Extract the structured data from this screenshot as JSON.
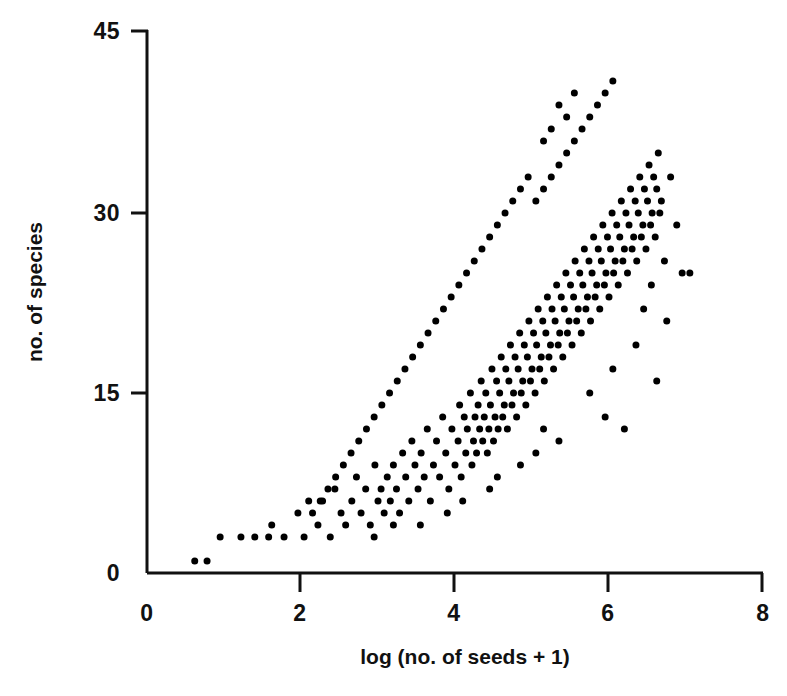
{
  "chart_data": {
    "type": "scatter",
    "title": "",
    "subtitle": "",
    "xlabel": "log (no. of seeds + 1)",
    "ylabel": "no. of species",
    "xlim": [
      0,
      8
    ],
    "ylim": [
      0,
      45
    ],
    "xticks": [
      0,
      2,
      4,
      6,
      8
    ],
    "yticks": [
      0,
      15,
      30,
      45
    ],
    "xtick_labels": [
      "0",
      "2",
      "4",
      "6",
      "8"
    ],
    "ytick_labels": [
      "0",
      "15",
      "30",
      "45"
    ],
    "grid": false,
    "legend": null,
    "marker": {
      "shape": "circle",
      "color": "#000000",
      "size_px": 7
    },
    "series": [
      {
        "name": "sites",
        "points": [
          [
            0.62,
            1
          ],
          [
            0.78,
            1
          ],
          [
            0.95,
            3
          ],
          [
            1.22,
            3
          ],
          [
            1.4,
            3
          ],
          [
            1.58,
            3
          ],
          [
            1.62,
            4
          ],
          [
            1.78,
            3
          ],
          [
            1.96,
            5
          ],
          [
            2.04,
            3
          ],
          [
            2.1,
            6
          ],
          [
            2.22,
            4
          ],
          [
            2.28,
            6
          ],
          [
            2.38,
            3
          ],
          [
            2.44,
            7
          ],
          [
            2.52,
            5
          ],
          [
            2.58,
            4
          ],
          [
            2.66,
            6
          ],
          [
            2.72,
            8
          ],
          [
            2.78,
            5
          ],
          [
            2.84,
            7
          ],
          [
            2.9,
            4
          ],
          [
            2.96,
            9
          ],
          [
            3.0,
            6
          ],
          [
            3.04,
            7
          ],
          [
            3.08,
            5
          ],
          [
            3.12,
            8
          ],
          [
            3.16,
            6
          ],
          [
            3.2,
            9
          ],
          [
            3.24,
            7
          ],
          [
            3.28,
            5
          ],
          [
            3.32,
            10
          ],
          [
            3.36,
            8
          ],
          [
            3.4,
            6
          ],
          [
            3.44,
            11
          ],
          [
            3.48,
            9
          ],
          [
            3.52,
            7
          ],
          [
            3.56,
            10
          ],
          [
            3.6,
            8
          ],
          [
            3.64,
            12
          ],
          [
            3.68,
            6
          ],
          [
            3.72,
            9
          ],
          [
            3.76,
            11
          ],
          [
            3.8,
            8
          ],
          [
            3.84,
            13
          ],
          [
            3.88,
            10
          ],
          [
            3.92,
            7
          ],
          [
            3.96,
            12
          ],
          [
            4.0,
            9
          ],
          [
            4.04,
            11
          ],
          [
            4.06,
            14
          ],
          [
            4.08,
            8
          ],
          [
            4.12,
            13
          ],
          [
            4.14,
            10
          ],
          [
            4.16,
            12
          ],
          [
            4.2,
            15
          ],
          [
            4.22,
            9
          ],
          [
            4.24,
            11
          ],
          [
            4.26,
            13
          ],
          [
            4.28,
            10
          ],
          [
            4.3,
            14
          ],
          [
            4.32,
            12
          ],
          [
            4.34,
            16
          ],
          [
            4.36,
            11
          ],
          [
            4.38,
            13
          ],
          [
            4.4,
            15
          ],
          [
            4.42,
            10
          ],
          [
            4.44,
            12
          ],
          [
            4.46,
            14
          ],
          [
            4.48,
            17
          ],
          [
            4.5,
            11
          ],
          [
            4.52,
            13
          ],
          [
            4.54,
            16
          ],
          [
            4.56,
            12
          ],
          [
            4.58,
            15
          ],
          [
            4.6,
            18
          ],
          [
            4.62,
            13
          ],
          [
            4.64,
            14
          ],
          [
            4.66,
            17
          ],
          [
            4.68,
            12
          ],
          [
            4.7,
            16
          ],
          [
            4.72,
            19
          ],
          [
            4.74,
            14
          ],
          [
            4.76,
            15
          ],
          [
            4.78,
            18
          ],
          [
            4.8,
            13
          ],
          [
            4.82,
            17
          ],
          [
            4.84,
            20
          ],
          [
            4.86,
            15
          ],
          [
            4.88,
            16
          ],
          [
            4.9,
            19
          ],
          [
            4.92,
            14
          ],
          [
            4.94,
            18
          ],
          [
            4.96,
            21
          ],
          [
            4.98,
            16
          ],
          [
            5.0,
            17
          ],
          [
            5.02,
            20
          ],
          [
            5.04,
            15
          ],
          [
            5.06,
            19
          ],
          [
            5.08,
            22
          ],
          [
            5.1,
            17
          ],
          [
            5.12,
            18
          ],
          [
            5.14,
            21
          ],
          [
            5.16,
            16
          ],
          [
            5.18,
            20
          ],
          [
            5.2,
            23
          ],
          [
            5.22,
            18
          ],
          [
            5.24,
            19
          ],
          [
            5.26,
            22
          ],
          [
            5.28,
            17
          ],
          [
            5.3,
            21
          ],
          [
            5.32,
            24
          ],
          [
            5.34,
            19
          ],
          [
            5.36,
            20
          ],
          [
            5.38,
            23
          ],
          [
            5.4,
            18
          ],
          [
            5.42,
            22
          ],
          [
            5.44,
            25
          ],
          [
            5.46,
            20
          ],
          [
            5.48,
            21
          ],
          [
            5.5,
            24
          ],
          [
            5.52,
            19
          ],
          [
            5.54,
            23
          ],
          [
            5.56,
            26
          ],
          [
            5.58,
            21
          ],
          [
            5.6,
            22
          ],
          [
            5.62,
            25
          ],
          [
            5.64,
            20
          ],
          [
            5.66,
            24
          ],
          [
            5.68,
            27
          ],
          [
            5.7,
            22
          ],
          [
            5.72,
            23
          ],
          [
            5.74,
            26
          ],
          [
            5.76,
            21
          ],
          [
            5.78,
            25
          ],
          [
            5.8,
            28
          ],
          [
            5.82,
            23
          ],
          [
            5.84,
            24
          ],
          [
            5.86,
            27
          ],
          [
            5.88,
            22
          ],
          [
            5.9,
            26
          ],
          [
            5.92,
            29
          ],
          [
            5.94,
            24
          ],
          [
            5.96,
            25
          ],
          [
            5.98,
            28
          ],
          [
            6.0,
            23
          ],
          [
            6.02,
            27
          ],
          [
            6.04,
            30
          ],
          [
            6.06,
            25
          ],
          [
            6.08,
            26
          ],
          [
            6.1,
            29
          ],
          [
            6.12,
            24
          ],
          [
            6.14,
            28
          ],
          [
            6.16,
            31
          ],
          [
            6.18,
            26
          ],
          [
            6.2,
            27
          ],
          [
            6.22,
            30
          ],
          [
            6.24,
            25
          ],
          [
            6.26,
            29
          ],
          [
            6.28,
            32
          ],
          [
            6.3,
            27
          ],
          [
            6.32,
            28
          ],
          [
            6.34,
            31
          ],
          [
            6.36,
            26
          ],
          [
            6.38,
            30
          ],
          [
            6.4,
            33
          ],
          [
            6.42,
            28
          ],
          [
            6.44,
            29
          ],
          [
            6.46,
            32
          ],
          [
            6.48,
            27
          ],
          [
            6.5,
            31
          ],
          [
            6.52,
            34
          ],
          [
            6.54,
            29
          ],
          [
            6.56,
            30
          ],
          [
            6.58,
            33
          ],
          [
            6.6,
            28
          ],
          [
            6.62,
            32
          ],
          [
            6.64,
            35
          ],
          [
            6.66,
            30
          ],
          [
            6.68,
            31
          ],
          [
            5.05,
            31
          ],
          [
            5.15,
            32
          ],
          [
            5.25,
            33
          ],
          [
            5.35,
            34
          ],
          [
            5.45,
            35
          ],
          [
            5.55,
            36
          ],
          [
            5.65,
            37
          ],
          [
            5.75,
            38
          ],
          [
            5.85,
            39
          ],
          [
            5.95,
            40
          ],
          [
            6.05,
            41
          ],
          [
            5.35,
            39
          ],
          [
            5.55,
            40
          ],
          [
            5.45,
            38
          ],
          [
            5.15,
            36
          ],
          [
            5.25,
            37
          ],
          [
            4.95,
            33
          ],
          [
            4.85,
            32
          ],
          [
            4.75,
            31
          ],
          [
            4.65,
            30
          ],
          [
            4.55,
            29
          ],
          [
            4.45,
            28
          ],
          [
            4.35,
            27
          ],
          [
            4.25,
            26
          ],
          [
            4.15,
            25
          ],
          [
            4.05,
            24
          ],
          [
            3.95,
            23
          ],
          [
            3.85,
            22
          ],
          [
            3.75,
            21
          ],
          [
            3.65,
            20
          ],
          [
            3.55,
            19
          ],
          [
            3.45,
            18
          ],
          [
            3.35,
            17
          ],
          [
            3.25,
            16
          ],
          [
            3.15,
            15
          ],
          [
            3.05,
            14
          ],
          [
            2.95,
            13
          ],
          [
            2.85,
            12
          ],
          [
            2.75,
            11
          ],
          [
            2.65,
            10
          ],
          [
            2.55,
            9
          ],
          [
            2.45,
            8
          ],
          [
            2.35,
            7
          ],
          [
            2.25,
            6
          ],
          [
            2.15,
            5
          ],
          [
            6.72,
            26
          ],
          [
            6.8,
            33
          ],
          [
            6.88,
            29
          ],
          [
            6.95,
            25
          ],
          [
            7.05,
            25
          ],
          [
            6.75,
            21
          ],
          [
            6.62,
            16
          ],
          [
            6.2,
            12
          ],
          [
            5.95,
            13
          ],
          [
            4.55,
            8
          ],
          [
            5.05,
            10
          ],
          [
            5.35,
            11
          ],
          [
            4.85,
            9
          ],
          [
            6.05,
            17
          ],
          [
            6.35,
            19
          ],
          [
            6.45,
            22
          ],
          [
            6.55,
            24
          ],
          [
            5.75,
            15
          ],
          [
            5.15,
            12
          ],
          [
            4.45,
            7
          ],
          [
            4.1,
            6
          ],
          [
            3.9,
            5
          ],
          [
            3.55,
            4
          ],
          [
            3.2,
            4
          ],
          [
            2.95,
            3
          ]
        ]
      }
    ],
    "n_points_approx": 500
  },
  "axes": {
    "spine_color": "#111111",
    "background": "#ffffff",
    "tick_direction": "outward"
  }
}
